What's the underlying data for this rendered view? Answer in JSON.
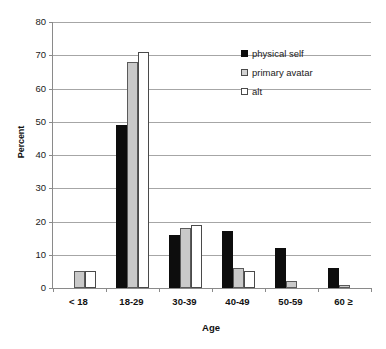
{
  "chart_data": {
    "type": "bar",
    "title": "",
    "xlabel": "Age",
    "ylabel": "Percent",
    "categories": [
      "< 18",
      "18-29",
      "30-39",
      "40-49",
      "50-59",
      "60 ≥"
    ],
    "series": [
      {
        "name": "physical self",
        "color": "#0d0d0d",
        "values": [
          0,
          49,
          16,
          17,
          12,
          6
        ]
      },
      {
        "name": "primary avatar",
        "color": "#c9c9c9",
        "values": [
          5,
          68,
          18,
          6,
          2,
          1
        ]
      },
      {
        "name": "alt",
        "color": "#ffffff",
        "values": [
          5,
          71,
          19,
          5,
          0,
          0
        ]
      }
    ],
    "ylim": [
      0,
      80
    ],
    "yticks": [
      0,
      10,
      20,
      30,
      40,
      50,
      60,
      70,
      80
    ],
    "ytick_labels": [
      "0",
      "10",
      "20",
      "30",
      "40",
      "50",
      "60",
      "70",
      "80"
    ],
    "grid": true,
    "legend_position": "top-right"
  },
  "legend": {
    "items": [
      {
        "label": "physical self",
        "swatch": "black-square-icon"
      },
      {
        "label": "primary avatar",
        "swatch": "gray-square-icon"
      },
      {
        "label": "alt",
        "swatch": "white-square-icon"
      }
    ]
  }
}
